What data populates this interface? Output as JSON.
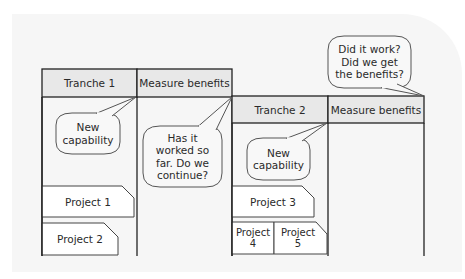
{
  "diagram": {
    "colors": {
      "header_fill": "#e8e8e8",
      "line": "#222222",
      "bubble_stroke": "#555555",
      "bubble_fill": "#f8f8f8",
      "box_fill": "#ffffff",
      "background_panel": "#f6f6f6"
    },
    "phase1": {
      "tranche_header": "Tranche 1",
      "measure_header": "Measure benefits",
      "bubble_capability": "New\ncapability",
      "bubble_question": "Has it\nworked so\nfar. Do we\ncontinue?",
      "projects": [
        "Project 1",
        "Project 2"
      ]
    },
    "phase2": {
      "tranche_header": "Tranche 2",
      "measure_header": "Measure benefits",
      "bubble_capability": "New\ncapability",
      "bubble_question": "Did it work?\nDid we get\nthe benefits?",
      "projects": [
        "Project 3",
        "Project\n4",
        "Project\n5"
      ]
    }
  }
}
